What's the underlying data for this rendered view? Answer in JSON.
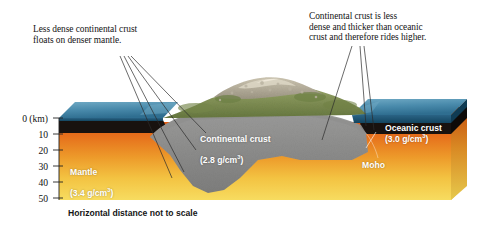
{
  "figure": {
    "type": "geological-cross-section",
    "caption": "Horizontal distance not to scale"
  },
  "annotations": [
    {
      "id": "left",
      "text": "Less dense continental crust\nfloats on denser mantle.",
      "leader_target": "continental crust root"
    },
    {
      "id": "right",
      "text": "Continental crust is less\ndense and thicker than oceanic\ncrust and therefore rides higher.",
      "leader_target": "continental crust margin and oceanic crust"
    }
  ],
  "axis": {
    "unit_label": "0 (km)",
    "ticks": [
      "0 (km)",
      "10",
      "20",
      "30",
      "40",
      "50"
    ],
    "values": [
      0,
      10,
      20,
      30,
      40,
      50
    ],
    "orientation": "vertical-depth"
  },
  "layers": {
    "continental_crust": {
      "name": "Continental crust",
      "density": "(2.8 g/cm",
      "density_sup": "3",
      "density_end": ")",
      "color": "#8d8d8c"
    },
    "oceanic_crust": {
      "name": "Oceanic crust",
      "density": "(3.0 g/cm",
      "density_sup": "3",
      "density_end": ")",
      "color": "#17120f"
    },
    "mantle": {
      "name": "Mantle",
      "density": "(3.4 g/cm",
      "density_sup": "3",
      "density_end": ")",
      "color_top": "#e2651a",
      "color_bottom": "#f5d34e"
    },
    "moho": {
      "name": "Moho",
      "description": "crust-mantle boundary"
    },
    "ocean": {
      "name": "Ocean water",
      "color": "#2e6f96"
    }
  },
  "colors": {
    "mantle_orange": "#e4661b",
    "mantle_yellow": "#f6d44f",
    "crust_gray": "#8b8b8a",
    "oceanic_black": "#17120f",
    "water_blue": "#3b7d9f",
    "water_blue_dark": "#20536f",
    "land_green": "#7d8c4e",
    "rock_tan": "#b3ab94",
    "text_dark": "#141414",
    "text_white": "#ffffff"
  }
}
